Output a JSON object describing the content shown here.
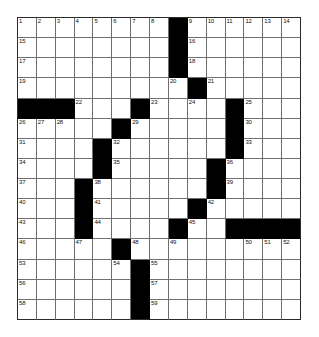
{
  "puzzle": {
    "type": "crossword-grid",
    "rows": 15,
    "cols": 15,
    "colors": {
      "block": "#000000",
      "cell": "#ffffff",
      "gridline": "#6f6f6f",
      "border": "#2b2b2b",
      "number": "#111111"
    },
    "blocks": [
      [
        0,
        8
      ],
      [
        1,
        8
      ],
      [
        2,
        8
      ],
      [
        3,
        9
      ],
      [
        4,
        0
      ],
      [
        4,
        1
      ],
      [
        4,
        2
      ],
      [
        4,
        6
      ],
      [
        4,
        11
      ],
      [
        5,
        5
      ],
      [
        5,
        11
      ],
      [
        6,
        4
      ],
      [
        6,
        11
      ],
      [
        7,
        4
      ],
      [
        7,
        10
      ],
      [
        8,
        3
      ],
      [
        8,
        10
      ],
      [
        9,
        3
      ],
      [
        9,
        9
      ],
      [
        10,
        3
      ],
      [
        10,
        8
      ],
      [
        10,
        11
      ],
      [
        10,
        12
      ],
      [
        10,
        13
      ],
      [
        10,
        14
      ],
      [
        11,
        5
      ],
      [
        12,
        6
      ],
      [
        13,
        6
      ],
      [
        14,
        6
      ]
    ],
    "numbers": [
      {
        "row": 0,
        "col": 0,
        "n": "1"
      },
      {
        "row": 0,
        "col": 1,
        "n": "2"
      },
      {
        "row": 0,
        "col": 2,
        "n": "3"
      },
      {
        "row": 0,
        "col": 3,
        "n": "4"
      },
      {
        "row": 0,
        "col": 4,
        "n": "5"
      },
      {
        "row": 0,
        "col": 5,
        "n": "6"
      },
      {
        "row": 0,
        "col": 6,
        "n": "7"
      },
      {
        "row": 0,
        "col": 7,
        "n": "8"
      },
      {
        "row": 0,
        "col": 9,
        "n": "9"
      },
      {
        "row": 0,
        "col": 10,
        "n": "10"
      },
      {
        "row": 0,
        "col": 11,
        "n": "11"
      },
      {
        "row": 0,
        "col": 12,
        "n": "12"
      },
      {
        "row": 0,
        "col": 13,
        "n": "13"
      },
      {
        "row": 0,
        "col": 14,
        "n": "14"
      },
      {
        "row": 1,
        "col": 0,
        "n": "15"
      },
      {
        "row": 1,
        "col": 9,
        "n": "16"
      },
      {
        "row": 2,
        "col": 0,
        "n": "17"
      },
      {
        "row": 2,
        "col": 9,
        "n": "18"
      },
      {
        "row": 3,
        "col": 0,
        "n": "19"
      },
      {
        "row": 3,
        "col": 8,
        "n": "20"
      },
      {
        "row": 3,
        "col": 10,
        "n": "21"
      },
      {
        "row": 4,
        "col": 3,
        "n": "22"
      },
      {
        "row": 4,
        "col": 7,
        "n": "23"
      },
      {
        "row": 4,
        "col": 9,
        "n": "24"
      },
      {
        "row": 4,
        "col": 12,
        "n": "25"
      },
      {
        "row": 5,
        "col": 0,
        "n": "26"
      },
      {
        "row": 5,
        "col": 1,
        "n": "27"
      },
      {
        "row": 5,
        "col": 2,
        "n": "28"
      },
      {
        "row": 5,
        "col": 6,
        "n": "29"
      },
      {
        "row": 5,
        "col": 12,
        "n": "30"
      },
      {
        "row": 6,
        "col": 0,
        "n": "31"
      },
      {
        "row": 6,
        "col": 5,
        "n": "32"
      },
      {
        "row": 6,
        "col": 12,
        "n": "33"
      },
      {
        "row": 7,
        "col": 0,
        "n": "34"
      },
      {
        "row": 7,
        "col": 5,
        "n": "35"
      },
      {
        "row": 7,
        "col": 11,
        "n": "36"
      },
      {
        "row": 8,
        "col": 0,
        "n": "37"
      },
      {
        "row": 8,
        "col": 4,
        "n": "38"
      },
      {
        "row": 8,
        "col": 11,
        "n": "39"
      },
      {
        "row": 9,
        "col": 0,
        "n": "40"
      },
      {
        "row": 9,
        "col": 4,
        "n": "41"
      },
      {
        "row": 9,
        "col": 10,
        "n": "42"
      },
      {
        "row": 10,
        "col": 0,
        "n": "43"
      },
      {
        "row": 10,
        "col": 4,
        "n": "44"
      },
      {
        "row": 10,
        "col": 9,
        "n": "45"
      },
      {
        "row": 11,
        "col": 0,
        "n": "46"
      },
      {
        "row": 11,
        "col": 3,
        "n": "47"
      },
      {
        "row": 11,
        "col": 6,
        "n": "48"
      },
      {
        "row": 11,
        "col": 8,
        "n": "49"
      },
      {
        "row": 11,
        "col": 12,
        "n": "50"
      },
      {
        "row": 11,
        "col": 13,
        "n": "51"
      },
      {
        "row": 11,
        "col": 14,
        "n": "52"
      },
      {
        "row": 12,
        "col": 0,
        "n": "53"
      },
      {
        "row": 12,
        "col": 5,
        "n": "54"
      },
      {
        "row": 12,
        "col": 7,
        "n": "55"
      },
      {
        "row": 13,
        "col": 0,
        "n": "56"
      },
      {
        "row": 13,
        "col": 7,
        "n": "57"
      },
      {
        "row": 14,
        "col": 0,
        "n": "58"
      },
      {
        "row": 14,
        "col": 7,
        "n": "59"
      }
    ]
  }
}
